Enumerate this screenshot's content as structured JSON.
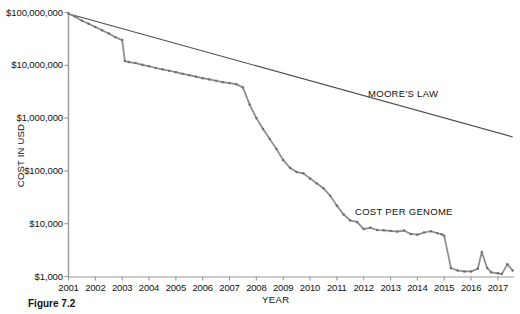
{
  "figure": {
    "caption": "Figure 7.2"
  },
  "chart_data": {
    "type": "line",
    "title": "",
    "xlabel": "YEAR",
    "ylabel": "COST IN USD",
    "yscale": "log",
    "ylim": [
      1000,
      100000000
    ],
    "xlim": [
      2001,
      2017.6
    ],
    "grid": false,
    "legend_position": "inline-annotation",
    "ytick_labels": [
      "$100,000,000",
      "$10,000,000",
      "$1,000,000",
      "$100,000",
      "$10,000",
      "$1,000"
    ],
    "ytick_values": [
      100000000,
      10000000,
      1000000,
      100000,
      10000,
      1000
    ],
    "xtick_labels": [
      "2001",
      "2002",
      "2003",
      "2004",
      "2005",
      "2006",
      "2007",
      "2008",
      "2009",
      "2010",
      "2011",
      "2012",
      "2013",
      "2014",
      "2015",
      "2016",
      "2017"
    ],
    "xtick_values": [
      2001,
      2002,
      2003,
      2004,
      2005,
      2006,
      2007,
      2008,
      2009,
      2010,
      2011,
      2012,
      2013,
      2014,
      2015,
      2016,
      2017
    ],
    "series": [
      {
        "name": "MOORE'S LAW",
        "annotation": "MOORE'S LAW",
        "color": "#4d4d4d",
        "x": [
          2001.0,
          2017.55
        ],
        "values": [
          95000000,
          440000
        ]
      },
      {
        "name": "COST PER GENOME",
        "annotation": "COST PER GENOME",
        "color": "#7a7a7a",
        "x": [
          2001.0,
          2001.25,
          2001.5,
          2001.75,
          2002.0,
          2002.25,
          2002.5,
          2002.75,
          2003.0,
          2003.1,
          2003.25,
          2003.5,
          2003.75,
          2004.0,
          2004.25,
          2004.5,
          2004.75,
          2005.0,
          2005.25,
          2005.5,
          2005.75,
          2006.0,
          2006.25,
          2006.5,
          2006.75,
          2007.0,
          2007.25,
          2007.5,
          2007.75,
          2008.0,
          2008.25,
          2008.5,
          2008.75,
          2009.0,
          2009.25,
          2009.5,
          2009.75,
          2010.0,
          2010.25,
          2010.5,
          2010.75,
          2011.0,
          2011.25,
          2011.5,
          2011.75,
          2012.0,
          2012.25,
          2012.5,
          2012.75,
          2013.0,
          2013.25,
          2013.5,
          2013.75,
          2014.0,
          2014.25,
          2014.5,
          2014.75,
          2014.9,
          2015.0,
          2015.25,
          2015.5,
          2015.75,
          2016.0,
          2016.25,
          2016.4,
          2016.6,
          2016.75,
          2017.0,
          2017.15,
          2017.35,
          2017.55
        ],
        "values": [
          95000000,
          83000000,
          70000000,
          61000000,
          53000000,
          46000000,
          40000000,
          34000000,
          30000000,
          12000000,
          11500000,
          11000000,
          10200000,
          9600000,
          8900000,
          8400000,
          7900000,
          7400000,
          6900000,
          6500000,
          6100000,
          5700000,
          5400000,
          5100000,
          4800000,
          4600000,
          4400000,
          3800000,
          1800000,
          1000000,
          620000,
          400000,
          260000,
          160000,
          115000,
          95000,
          90000,
          72000,
          58000,
          47000,
          34000,
          22000,
          15000,
          11500,
          10800,
          7900,
          8400,
          7600,
          7500,
          7300,
          7100,
          7400,
          6400,
          6200,
          6800,
          7200,
          6600,
          6300,
          5900,
          1450,
          1300,
          1250,
          1250,
          1400,
          2900,
          1450,
          1200,
          1150,
          1120,
          1700,
          1300
        ]
      }
    ]
  },
  "axes": {
    "y_title": "COST IN USD",
    "x_title": "YEAR"
  }
}
